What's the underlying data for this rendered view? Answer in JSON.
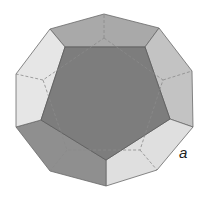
{
  "figure": {
    "label": "a",
    "colors": {
      "front_face": "#7d7d7d",
      "top_face": "#a8a8a8",
      "upper_left_face": "#e4e4e4",
      "upper_right_face": "#c2c2c2",
      "lower_left_face": "#8e8e8e",
      "lower_right_face": "#dedede",
      "edge": "#6a6a6a",
      "hidden_edge": "#8a8a8a"
    }
  }
}
